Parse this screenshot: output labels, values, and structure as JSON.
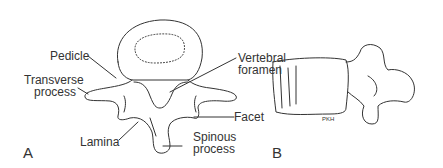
{
  "figure": {
    "panel_a": {
      "letter": "A",
      "labels": {
        "pedicle": "Pedicle",
        "transverse_process_1": "Transverse",
        "transverse_process_2": "process",
        "vertebral_foramen_1": "Vertebral",
        "vertebral_foramen_2": "foramen",
        "facet": "Facet",
        "lamina": "Lamina",
        "spinous_process_1": "Spinous",
        "spinous_process_2": "process"
      }
    },
    "panel_b": {
      "letter": "B",
      "signature": "PKH"
    }
  }
}
